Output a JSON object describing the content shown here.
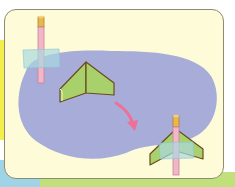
{
  "diagram": {
    "steps": [
      {
        "id": "straw-with-tape",
        "label": ""
      },
      {
        "id": "folded-wing",
        "label": ""
      },
      {
        "id": "assembled-rocket",
        "label": ""
      }
    ],
    "colors": {
      "panel": "#fdfbd8",
      "panel_border": "#8e8a74",
      "blob": "#a7acd9",
      "wing": "#a9d16b",
      "wing_edge": "#6b4a1e",
      "straw": "#f2b6c8",
      "straw_cap": "#e8b84a",
      "tape": "#a9d8e0",
      "arrow": "#ef6f95"
    }
  }
}
